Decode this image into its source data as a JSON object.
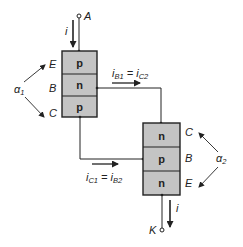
{
  "diagram": {
    "colors": {
      "block_fill": "#c4c4c4",
      "stroke": "#222222",
      "background": "#ffffff"
    },
    "terminals": {
      "anode": "A",
      "cathode": "K"
    },
    "currents": {
      "top": "i",
      "bottom": "i"
    },
    "transistor1": {
      "layers": [
        "p",
        "n",
        "p"
      ],
      "terminal_labels": [
        "E",
        "B",
        "C"
      ],
      "alpha_symbol": "α",
      "alpha_subscript": "1"
    },
    "transistor2": {
      "layers": [
        "n",
        "p",
        "n"
      ],
      "terminal_labels": [
        "C",
        "B",
        "E"
      ],
      "alpha_symbol": "α",
      "alpha_subscript": "2"
    },
    "link_top": {
      "lhs": "i",
      "lhs_sub": "B1",
      "eq": " = ",
      "rhs": "i",
      "rhs_sub": "C2"
    },
    "link_bottom": {
      "lhs": "i",
      "lhs_sub": "C1",
      "eq": " = ",
      "rhs": "i",
      "rhs_sub": "B2"
    }
  }
}
